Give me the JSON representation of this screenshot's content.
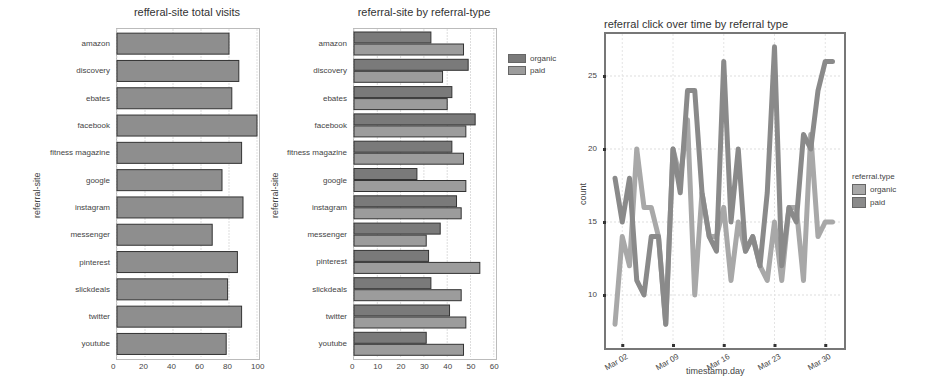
{
  "chart_data": [
    {
      "type": "bar",
      "orientation": "horizontal",
      "title": "refferal-site total visits",
      "xlabel": "",
      "ylabel": "referral-site",
      "categories": [
        "amazon",
        "discovery",
        "ebates",
        "facebook",
        "fitness magazine",
        "google",
        "instagram",
        "messenger",
        "pinterest",
        "slickdeals",
        "twitter",
        "youtube"
      ],
      "values": [
        80,
        87,
        82,
        100,
        89,
        75,
        90,
        68,
        86,
        79,
        89,
        78
      ],
      "xlim": [
        0,
        100
      ],
      "xticks": [
        0,
        20,
        40,
        60,
        80,
        100
      ],
      "grid": true
    },
    {
      "type": "bar",
      "orientation": "horizontal",
      "grouped": true,
      "title": "referral-site by referral-type",
      "xlabel": "",
      "ylabel": "referral-site",
      "categories": [
        "amazon",
        "discovery",
        "ebates",
        "facebook",
        "fitness magazine",
        "google",
        "instagram",
        "messenger",
        "pinterest",
        "slickdeals",
        "twitter",
        "youtube"
      ],
      "series": [
        {
          "name": "organic",
          "color": "#7a7a7a",
          "values": [
            33,
            49,
            42,
            52,
            42,
            27,
            44,
            37,
            32,
            33,
            41,
            31
          ]
        },
        {
          "name": "paid",
          "color": "#9c9c9c",
          "values": [
            47,
            38,
            40,
            48,
            47,
            48,
            46,
            31,
            54,
            46,
            48,
            47
          ]
        }
      ],
      "xlim": [
        0,
        60
      ],
      "xticks": [
        0,
        10,
        20,
        30,
        40,
        50,
        60
      ],
      "legend_position": "right",
      "grid": true
    },
    {
      "type": "line",
      "title": "referral click over time by referral type",
      "xlabel": "timestamp.day",
      "ylabel": "count",
      "x": [
        "Mar 01",
        "Mar 02",
        "Mar 03",
        "Mar 04",
        "Mar 05",
        "Mar 06",
        "Mar 07",
        "Mar 08",
        "Mar 09",
        "Mar 10",
        "Mar 11",
        "Mar 12",
        "Mar 13",
        "Mar 14",
        "Mar 15",
        "Mar 16",
        "Mar 17",
        "Mar 18",
        "Mar 19",
        "Mar 20",
        "Mar 21",
        "Mar 22",
        "Mar 23",
        "Mar 24",
        "Mar 25",
        "Mar 26",
        "Mar 27",
        "Mar 28",
        "Mar 29",
        "Mar 30",
        "Mar 31"
      ],
      "xticks": [
        "Mar 02",
        "Mar 09",
        "Mar 16",
        "Mar 23",
        "Mar 30"
      ],
      "series": [
        {
          "name": "organic",
          "color": "#a8a8a8",
          "values": [
            8,
            14,
            12,
            20,
            16,
            16,
            14,
            8,
            20,
            18,
            22,
            10,
            17,
            14,
            14,
            16,
            11,
            15,
            13,
            14,
            12,
            11,
            15,
            11,
            16,
            16,
            11,
            21,
            14,
            15,
            15
          ]
        },
        {
          "name": "paid",
          "color": "#8a8a8a",
          "values": [
            18,
            15,
            18,
            11,
            10,
            14,
            14,
            8,
            20,
            17,
            24,
            24,
            17,
            14,
            13,
            26,
            15,
            20,
            13,
            14,
            12,
            17,
            27,
            12,
            16,
            15,
            21,
            20,
            24,
            26,
            26
          ]
        }
      ],
      "ylim": [
        7,
        28
      ],
      "yticks": [
        10,
        15,
        20,
        25
      ],
      "legend_title": "referral.type",
      "legend_position": "right",
      "grid": true
    }
  ],
  "labels": {
    "chart1_title": "refferal-site total visits",
    "chart1_ylabel": "referral-site",
    "chart2_title": "referral-site by referral-type",
    "chart2_ylabel": "referral-site",
    "chart3_title": "referral click over time by referral type",
    "chart3_xlabel": "timestamp.day",
    "chart3_ylabel": "count",
    "chart3_legend_title": "referral.type",
    "legend_organic": "organic",
    "legend_paid": "paid"
  }
}
